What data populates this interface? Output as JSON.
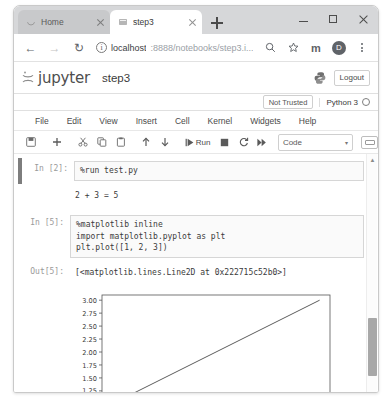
{
  "browser": {
    "tabs": [
      {
        "title": "Home",
        "favicon": "jupyter-circle-icon",
        "active": false
      },
      {
        "title": "step3",
        "favicon": "notebook-icon",
        "active": true
      }
    ],
    "new_tab_label": "+",
    "window_controls": {
      "minimize": "minimize",
      "maximize": "maximize",
      "close": "close"
    },
    "nav": {
      "back": "←",
      "forward": "→",
      "reload": "↻"
    },
    "omnibox": {
      "info_glyph": "i",
      "url_host": "localhost",
      "url_path": ":8888/notebooks/step3.i...",
      "zoom_icon": "zoom-search-icon",
      "bookmark_icon": "star-icon"
    },
    "extension_label": "m",
    "avatar_label": "D",
    "menu_icon": "kebab-menu-icon"
  },
  "jupyter": {
    "logo_text": "jupyter",
    "notebook_title": "step3",
    "logout_label": "Logout",
    "python_logo": "python-logo-icon",
    "trust_status": "Not Trusted",
    "kernel_name": "Python 3",
    "kernel_status": "idle",
    "menu": [
      "File",
      "Edit",
      "View",
      "Insert",
      "Cell",
      "Kernel",
      "Widgets",
      "Help"
    ],
    "toolbar": {
      "save": "save-icon",
      "add": "add-cell-icon",
      "cut": "cut-icon",
      "copy": "copy-icon",
      "paste": "paste-icon",
      "move_up": "arrow-up-icon",
      "move_down": "arrow-down-icon",
      "run_label": "Run",
      "stop": "stop-icon",
      "restart": "restart-icon",
      "restart_run_all": "fast-forward-icon",
      "cell_type": "Code",
      "cell_type_caret": "▾",
      "keyboard_shortcut": "keyboard-icon"
    }
  },
  "notebook": {
    "cells": [
      {
        "prompt": "In [2]:",
        "source": "%run test.py",
        "output_text": "2 + 3 = 5"
      },
      {
        "prompt": "In [5]:",
        "source": "%matplotlib inline\nimport matplotlib.pyplot as plt\nplt.plot([1, 2, 3])",
        "out_prompt": "Out[5]:",
        "out_text": "[<matplotlib.lines.Line2D at 0x222715c52b0>]"
      }
    ]
  },
  "chart_data": {
    "type": "line",
    "title": "",
    "xlabel": "",
    "ylabel": "",
    "x": [
      0,
      1,
      2
    ],
    "series": [
      {
        "name": "line",
        "values": [
          1,
          2,
          3
        ],
        "color": "#4a4a4a"
      }
    ],
    "xlim": [
      -0.1,
      2.1
    ],
    "ylim": [
      0.9,
      3.1
    ],
    "xticks": [
      "0.00",
      "0.25",
      "0.50",
      "0.75",
      "1.00",
      "1.25",
      "1.50",
      "1.75",
      "2.00"
    ],
    "xtick_values": [
      0,
      0.25,
      0.5,
      0.75,
      1.0,
      1.25,
      1.5,
      1.75,
      2.0
    ],
    "yticks": [
      "1.00",
      "1.25",
      "1.50",
      "1.75",
      "2.00",
      "2.25",
      "2.50",
      "2.75",
      "3.00"
    ],
    "ytick_values": [
      1.0,
      1.25,
      1.5,
      1.75,
      2.0,
      2.25,
      2.5,
      2.75,
      3.0
    ],
    "grid": false,
    "legend": false
  }
}
